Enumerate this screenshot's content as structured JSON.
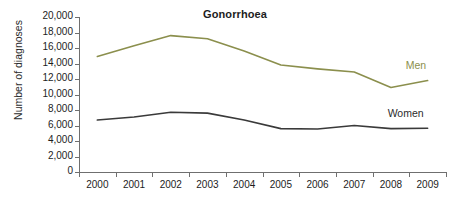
{
  "chart_data": {
    "type": "line",
    "title": "Gonorrhoea",
    "xlabel": "",
    "ylabel": "Number of diagnoses",
    "categories": [
      "2000",
      "2001",
      "2002",
      "2003",
      "2004",
      "2005",
      "2006",
      "2007",
      "2008",
      "2009"
    ],
    "x": [
      2000,
      2001,
      2002,
      2003,
      2004,
      2005,
      2006,
      2007,
      2008,
      2009
    ],
    "ylim": [
      0,
      20000
    ],
    "yticks": [
      0,
      2000,
      4000,
      6000,
      8000,
      10000,
      12000,
      14000,
      16000,
      18000,
      20000
    ],
    "ytick_labels": [
      "0",
      "2,000",
      "4,000",
      "6,000",
      "8,000",
      "10,000",
      "12,000",
      "14,000",
      "16,000",
      "18,000",
      "20,000"
    ],
    "grid": false,
    "legend_position": "inline-right",
    "series": [
      {
        "name": "Men",
        "color": "#8b8f4d",
        "values": [
          14900,
          16300,
          17600,
          17200,
          15600,
          13800,
          13300,
          12900,
          10900,
          11800
        ]
      },
      {
        "name": "Women",
        "color": "#3a3a3a",
        "values": [
          6700,
          7100,
          7700,
          7600,
          6700,
          5600,
          5550,
          6000,
          5600,
          5650
        ]
      }
    ]
  },
  "colors": {
    "men": "#8b8f4d",
    "women": "#3a3a3a",
    "axis": "#6f6f6f",
    "text": "#1d1d1d",
    "background": "#ffffff"
  }
}
